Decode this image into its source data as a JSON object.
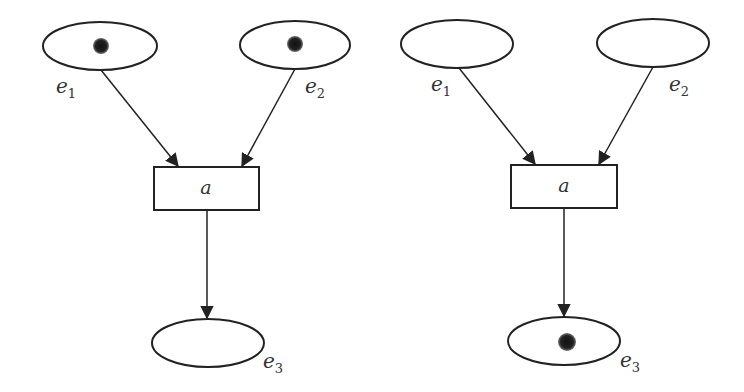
{
  "diagram": {
    "type": "petri-net-firing",
    "colors": {
      "stroke": "#222222",
      "token": "#111111",
      "background": "#ffffff"
    },
    "panels": [
      {
        "name": "before-firing",
        "places": [
          {
            "id": "e1",
            "label": "e",
            "sub": "1",
            "tokens": 1
          },
          {
            "id": "e2",
            "label": "e",
            "sub": "2",
            "tokens": 1
          },
          {
            "id": "e3",
            "label": "e",
            "sub": "3",
            "tokens": 0
          }
        ],
        "transition": {
          "label": "a"
        }
      },
      {
        "name": "after-firing",
        "places": [
          {
            "id": "e1",
            "label": "e",
            "sub": "1",
            "tokens": 0
          },
          {
            "id": "e2",
            "label": "e",
            "sub": "2",
            "tokens": 0
          },
          {
            "id": "e3",
            "label": "e",
            "sub": "3",
            "tokens": 1
          }
        ],
        "transition": {
          "label": "a"
        }
      }
    ],
    "arcs": [
      {
        "from": "e1",
        "to": "a"
      },
      {
        "from": "e2",
        "to": "a"
      },
      {
        "from": "a",
        "to": "e3"
      }
    ]
  }
}
